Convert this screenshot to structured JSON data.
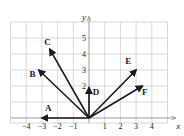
{
  "diagram": {
    "type": "vector-plot",
    "axes": {
      "x_label": "x",
      "y_label": "y",
      "x_ticks": [
        "-4",
        "-3",
        "-2",
        "-1",
        "1",
        "2",
        "3",
        "4"
      ],
      "x_tick_values": [
        -4,
        -3,
        -2,
        -1,
        1,
        2,
        3,
        4
      ],
      "y_ticks": [
        "2",
        "3",
        "4",
        "5"
      ],
      "y_tick_values": [
        2,
        3,
        4,
        5
      ],
      "x_range": [
        -5,
        5
      ],
      "y_range": [
        -0.4,
        6
      ]
    },
    "grid": {
      "on": true,
      "color": "#cfcfcf",
      "axis_color": "#999999"
    },
    "vectors": [
      {
        "label": "A",
        "x": -3,
        "y": 0,
        "label_x": -2.6,
        "label_y": 0.45
      },
      {
        "label": "B",
        "x": -3.2,
        "y": 3,
        "label_x": -3.6,
        "label_y": 2.55
      },
      {
        "label": "C",
        "x": -2.5,
        "y": 4.3,
        "label_x": -2.65,
        "label_y": 4.55
      },
      {
        "label": "D",
        "x": 0,
        "y": 1.9,
        "label_x": 0.45,
        "label_y": 1.45
      },
      {
        "label": "E",
        "x": 3,
        "y": 3,
        "label_x": 2.5,
        "label_y": 3.35
      },
      {
        "label": "F",
        "x": 3.4,
        "y": 2,
        "label_x": 3.55,
        "label_y": 1.45
      }
    ],
    "vector_color": "#1a1a1a"
  }
}
